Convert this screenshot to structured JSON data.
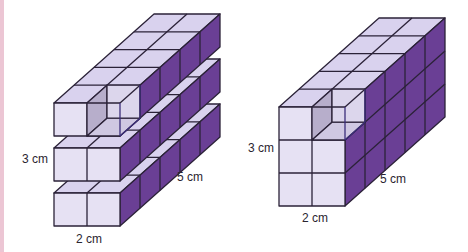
{
  "colors": {
    "front": "#e6e1f3",
    "top": "#d9d2ee",
    "side": "#6a3f95",
    "side_dark": "#5a3184",
    "edge": "#2b2238",
    "hollow": "#b7aecb",
    "margin_strip": "#ecc6d4"
  },
  "cube": {
    "size": 33,
    "dx": 20,
    "dy": -17.8
  },
  "figures": [
    {
      "id": "layered-prism",
      "description": "2 x 5 x 3 cuboid of unit cubes shown as three separated layers",
      "width_cubes": 2,
      "depth_cubes": 5,
      "layers": [
        {
          "front_left_x": 54,
          "front_top_y": 103
        },
        {
          "front_left_x": 54,
          "front_top_y": 148
        },
        {
          "front_left_x": 54,
          "front_top_y": 193
        }
      ],
      "labels": {
        "height": "3 cm",
        "depth": "5 cm",
        "width": "2 cm"
      }
    },
    {
      "id": "solid-prism",
      "description": "2 x 5 x 3 cuboid of unit cubes shown as a solid block",
      "width_cubes": 2,
      "depth_cubes": 5,
      "height_cubes": 3,
      "front_left_x": 279,
      "front_top_y": 107,
      "labels": {
        "height": "3 cm",
        "depth": "5 cm",
        "width": "2 cm"
      }
    }
  ]
}
